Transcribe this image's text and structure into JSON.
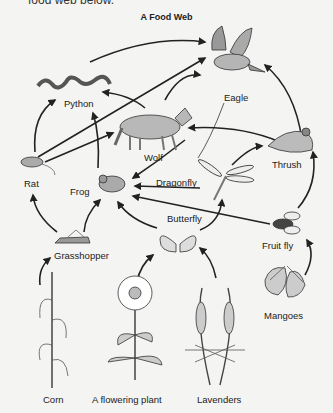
{
  "header": {
    "cut_text": "food web below.",
    "title": "A Food Web"
  },
  "organisms": [
    {
      "id": "eagle",
      "label": "Eagle"
    },
    {
      "id": "python",
      "label": "Python"
    },
    {
      "id": "wolf",
      "label": "Wolf"
    },
    {
      "id": "rat",
      "label": "Rat"
    },
    {
      "id": "frog",
      "label": "Frog"
    },
    {
      "id": "dragonfly",
      "label": "Dragonfly"
    },
    {
      "id": "thrush",
      "label": "Thrush"
    },
    {
      "id": "butterfly",
      "label": "Butterfly"
    },
    {
      "id": "fruitfly",
      "label": "Fruit fly"
    },
    {
      "id": "grasshopper",
      "label": "Grasshopper"
    },
    {
      "id": "mangoes",
      "label": "Mangoes"
    },
    {
      "id": "corn",
      "label": "Corn"
    },
    {
      "id": "flowering",
      "label": "A flowering plant"
    },
    {
      "id": "lavenders",
      "label": "Lavenders"
    }
  ],
  "arrows": [
    [
      "corn",
      "grasshopper"
    ],
    [
      "flowering",
      "butterfly"
    ],
    [
      "lavenders",
      "butterfly"
    ],
    [
      "mangoes",
      "fruitfly"
    ],
    [
      "grasshopper",
      "rat"
    ],
    [
      "grasshopper",
      "frog"
    ],
    [
      "butterfly",
      "frog"
    ],
    [
      "butterfly",
      "dragonfly"
    ],
    [
      "fruitfly",
      "frog"
    ],
    [
      "fruitfly",
      "dragonfly"
    ],
    [
      "fruitfly",
      "thrush"
    ],
    [
      "dragonfly",
      "frog"
    ],
    [
      "dragonfly",
      "thrush"
    ],
    [
      "rat",
      "python"
    ],
    [
      "rat",
      "wolf"
    ],
    [
      "rat",
      "eagle"
    ],
    [
      "frog",
      "python"
    ],
    [
      "frog",
      "eagle"
    ],
    [
      "wolf",
      "python"
    ],
    [
      "wolf",
      "eagle"
    ],
    [
      "wolf",
      "frog"
    ],
    [
      "thrush",
      "wolf"
    ],
    [
      "thrush",
      "eagle"
    ],
    [
      "python",
      "eagle"
    ]
  ],
  "colors": {
    "background": "#f4f4f2",
    "ink": "#222222",
    "fill": "#bdbdbd"
  }
}
